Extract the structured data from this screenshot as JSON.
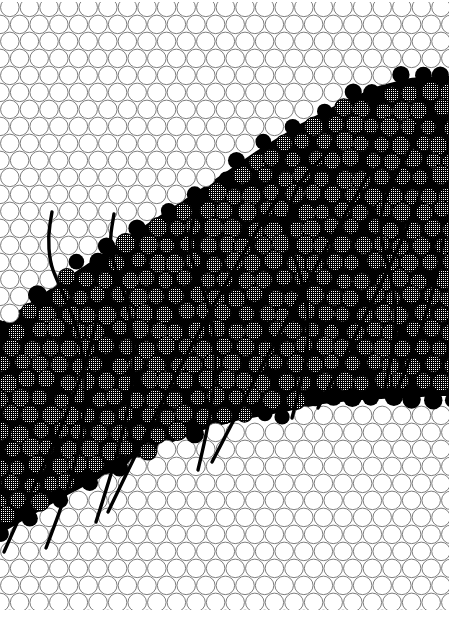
{
  "figure": {
    "kind": "micrograph-illustration",
    "caption": "Hexagonal close packed raft of equal bubbles containing an inclined sheared band of strained (cross-hatched) bubbles bounded by rows of solid black dislocation bubbles and crossed by heavy slip traces.",
    "width": 457,
    "height": 630
  },
  "canvas": {
    "background_color": "#ffffff",
    "margin_right_px": 8,
    "margin_bottom_px": 20,
    "margin_top_px": 2,
    "margin_left_px": 0
  },
  "colors": {
    "background": "#ffffff",
    "matrix_outline": "#6f6f6f",
    "matrix_fill": "#ffffff",
    "interstitial_black": "#000000",
    "strained_outline": "#000000",
    "strained_hatch": "#000000",
    "strained_base": "#ffffff",
    "boundary_atom": "#000000",
    "slip_line": "#000000"
  },
  "lattice": {
    "type": "hexagonal-close-packed",
    "circle_diameter_px": 19.6,
    "row_pitch_px": 17.0,
    "column_pitch_px": 19.6,
    "row_offset_px": 9.8,
    "outline_width_px": 0.9,
    "rows": 38,
    "cols": 25
  },
  "band": {
    "label": "deformation band",
    "orientation_degrees": 27,
    "upper_boundary": [
      [
        -10,
        330
      ],
      [
        40,
        296
      ],
      [
        96,
        258
      ],
      [
        150,
        222
      ],
      [
        205,
        186
      ],
      [
        258,
        150
      ],
      [
        300,
        124
      ],
      [
        342,
        102
      ],
      [
        378,
        86
      ],
      [
        410,
        78
      ],
      [
        440,
        76
      ]
    ],
    "lower_boundary": [
      [
        -10,
        540
      ],
      [
        24,
        520
      ],
      [
        62,
        498
      ],
      [
        104,
        476
      ],
      [
        150,
        452
      ],
      [
        196,
        432
      ],
      [
        240,
        420
      ],
      [
        284,
        412
      ],
      [
        322,
        404
      ],
      [
        360,
        400
      ],
      [
        400,
        398
      ],
      [
        440,
        396
      ]
    ]
  },
  "strained_texture": {
    "pattern": "cross-hatch-grid",
    "hatch_pitch_px": 2.4,
    "hatch_line_px": 1.0,
    "description": "fine orthogonal grid fill inside each strained bubble"
  },
  "slip_lines": {
    "count": 10,
    "stroke_width_px": 3.4,
    "style": "heavy solid curves",
    "paths": [
      {
        "name": "slip-trace-1",
        "points": [
          [
            4,
            552
          ],
          [
            28,
            498
          ],
          [
            54,
            444
          ],
          [
            74,
            396
          ],
          [
            88,
            356
          ],
          [
            96,
            322
          ]
        ]
      },
      {
        "name": "slip-trace-2",
        "points": [
          [
            46,
            548
          ],
          [
            62,
            506
          ],
          [
            74,
            468
          ],
          [
            82,
            432
          ],
          [
            86,
            398
          ],
          [
            84,
            362
          ],
          [
            78,
            330
          ],
          [
            66,
            300
          ],
          [
            56,
            278
          ],
          [
            50,
            262
          ],
          [
            48,
            236
          ],
          [
            52,
            212
          ]
        ]
      },
      {
        "name": "slip-trace-3",
        "points": [
          [
            96,
            522
          ],
          [
            110,
            478
          ],
          [
            122,
            436
          ],
          [
            130,
            398
          ],
          [
            134,
            360
          ],
          [
            132,
            326
          ],
          [
            126,
            298
          ],
          [
            118,
            276
          ],
          [
            112,
            258
          ],
          [
            110,
            238
          ],
          [
            114,
            214
          ]
        ]
      },
      {
        "name": "slip-trace-4",
        "points": [
          [
            108,
            512
          ],
          [
            134,
            458
          ],
          [
            160,
            406
          ],
          [
            186,
            356
          ],
          [
            212,
            308
          ],
          [
            236,
            266
          ],
          [
            256,
            232
          ],
          [
            272,
            206
          ],
          [
            284,
            188
          ]
        ]
      },
      {
        "name": "slip-trace-5",
        "points": [
          [
            198,
            470
          ],
          [
            208,
            428
          ],
          [
            214,
            388
          ],
          [
            216,
            352
          ],
          [
            212,
            318
          ],
          [
            204,
            292
          ],
          [
            196,
            272
          ],
          [
            190,
            254
          ],
          [
            190,
            232
          ],
          [
            196,
            210
          ],
          [
            208,
            192
          ]
        ]
      },
      {
        "name": "slip-trace-6",
        "points": [
          [
            212,
            462
          ],
          [
            238,
            412
          ],
          [
            264,
            362
          ],
          [
            290,
            314
          ],
          [
            314,
            270
          ],
          [
            334,
            234
          ],
          [
            350,
            206
          ],
          [
            362,
            186
          ],
          [
            370,
            170
          ]
        ]
      },
      {
        "name": "slip-trace-7",
        "points": [
          [
            292,
            418
          ],
          [
            302,
            380
          ],
          [
            308,
            344
          ],
          [
            308,
            310
          ],
          [
            302,
            280
          ],
          [
            294,
            256
          ],
          [
            288,
            236
          ],
          [
            288,
            214
          ],
          [
            294,
            192
          ],
          [
            306,
            174
          ],
          [
            320,
            160
          ],
          [
            330,
            150
          ],
          [
            334,
            138
          ]
        ]
      },
      {
        "name": "slip-trace-8",
        "points": [
          [
            318,
            408
          ],
          [
            342,
            362
          ],
          [
            364,
            318
          ],
          [
            384,
            278
          ],
          [
            400,
            244
          ],
          [
            412,
            216
          ],
          [
            420,
            194
          ]
        ]
      },
      {
        "name": "slip-trace-9",
        "points": [
          [
            384,
            392
          ],
          [
            392,
            356
          ],
          [
            396,
            322
          ],
          [
            394,
            292
          ],
          [
            388,
            266
          ],
          [
            382,
            244
          ],
          [
            380,
            222
          ],
          [
            384,
            200
          ],
          [
            394,
            178
          ],
          [
            406,
            158
          ],
          [
            414,
            142
          ],
          [
            416,
            126
          ]
        ]
      },
      {
        "name": "slip-trace-10",
        "points": [
          [
            398,
            388
          ],
          [
            412,
            354
          ],
          [
            424,
            320
          ],
          [
            434,
            288
          ],
          [
            440,
            260
          ],
          [
            444,
            236
          ]
        ]
      }
    ]
  },
  "annotations": {
    "matrix_region_label": "undeformed close-packed raft",
    "band_region_label": "sheared / strained region",
    "boundary_label": "dislocation row"
  }
}
